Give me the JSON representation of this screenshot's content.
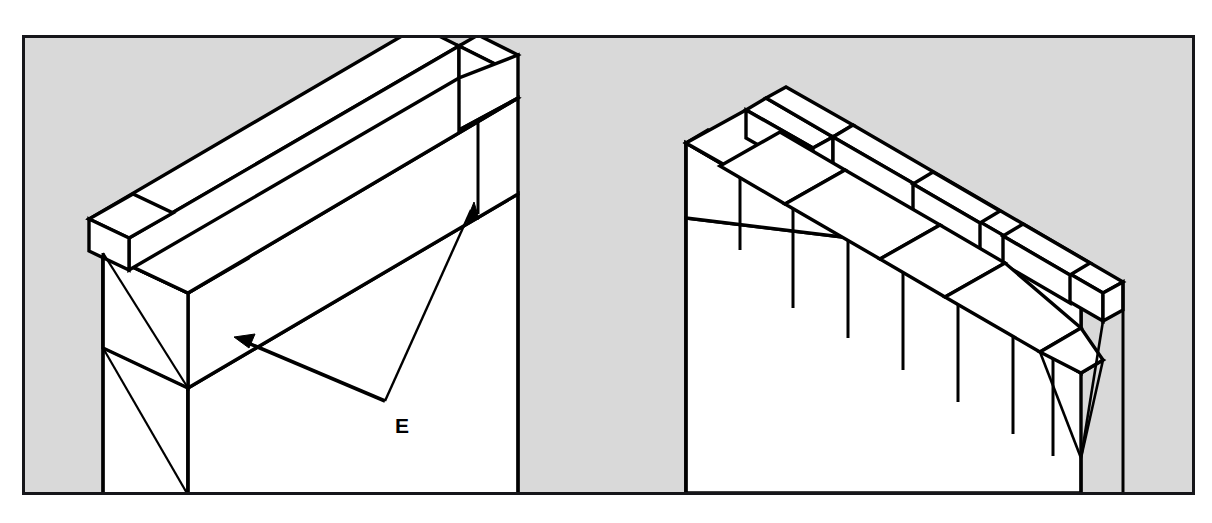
{
  "figure": {
    "kind": "isometric-line-drawing",
    "background_color": "#d9d9d9",
    "paper_color": "#ffffff",
    "ink_color": "#000000",
    "frame": {
      "border_color": "#16161a",
      "border_width_px": 3
    },
    "panels": [
      {
        "id": "left-detail",
        "name": "left-corner-detail",
        "description": "Wall corner with a long header course running back, single quoin block at near corner, two arrows labelled E",
        "wall_faces": 2
      },
      {
        "id": "right-detail",
        "name": "right-corner-detail",
        "description": "Wall corner with alternating stretcher and header courses forming the quoin bond",
        "wall_faces": 2
      }
    ],
    "callouts": [
      {
        "label": "E",
        "label_x": 392,
        "label_y": 422,
        "leader_origin": {
          "x": 382,
          "y": 398
        },
        "arrow_targets": [
          {
            "x": 232,
            "y": 336,
            "name": "arrow-target-near-quoin"
          },
          {
            "x": 466,
            "y": 201,
            "name": "arrow-target-far-quoin"
          }
        ]
      }
    ]
  }
}
